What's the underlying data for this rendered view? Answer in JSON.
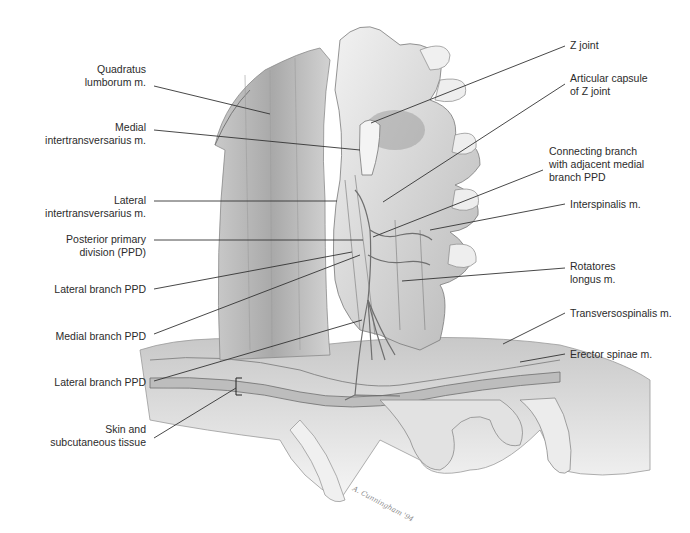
{
  "figure": {
    "signature": "A. Cunningham '94"
  },
  "labels_left": [
    {
      "id": "quadratus-lumborum",
      "lines": [
        "Quadratus",
        "lumborum m."
      ],
      "x": 146,
      "y": 70,
      "leader": [
        [
          154,
          86
        ],
        [
          270,
          114
        ]
      ]
    },
    {
      "id": "medial-intertransversarius",
      "lines": [
        "Medial",
        "intertransversarius m."
      ],
      "x": 146,
      "y": 121,
      "leader": [
        [
          154,
          130
        ],
        [
          360,
          150
        ]
      ]
    },
    {
      "id": "lateral-intertransversarius",
      "lines": [
        "Lateral",
        "intertransversarius m."
      ],
      "x": 146,
      "y": 187,
      "leader": [
        [
          154,
          201
        ],
        [
          337,
          201
        ]
      ]
    },
    {
      "id": "posterior-primary-division",
      "lines": [
        "Posterior primary",
        "division (PPD)"
      ],
      "x": 146,
      "y": 229,
      "leader": [
        [
          154,
          240
        ],
        [
          363,
          240
        ]
      ]
    },
    {
      "id": "lateral-branch-ppd-1",
      "lines": [
        "Lateral branch PPD"
      ],
      "x": 146,
      "y": 284,
      "leader": [
        [
          154,
          289
        ],
        [
          352,
          252
        ]
      ]
    },
    {
      "id": "medial-branch-ppd",
      "lines": [
        "Medial branch PPD"
      ],
      "x": 146,
      "y": 330,
      "leader": [
        [
          154,
          334
        ],
        [
          360,
          255
        ]
      ]
    },
    {
      "id": "lateral-branch-ppd-2",
      "lines": [
        "Lateral branch PPD"
      ],
      "x": 146,
      "y": 377,
      "leader": [
        [
          154,
          381
        ],
        [
          362,
          320
        ]
      ]
    },
    {
      "id": "skin-subcutaneous",
      "lines": [
        "Skin and",
        "subcutaneous tissue"
      ],
      "x": 146,
      "y": 425,
      "leader": [
        [
          154,
          438
        ],
        [
          236,
          388
        ]
      ]
    }
  ],
  "labels_right": [
    {
      "id": "z-joint",
      "lines": [
        "Z joint"
      ],
      "x": 570,
      "y": 39,
      "leader": [
        [
          565,
          46
        ],
        [
          371,
          123
        ]
      ]
    },
    {
      "id": "articular-capsule",
      "lines": [
        "Articular capsule",
        "of Z joint"
      ],
      "x": 570,
      "y": 72,
      "leader": [
        [
          565,
          84
        ],
        [
          383,
          202
        ]
      ]
    },
    {
      "id": "connecting-branch",
      "lines": [
        "Connecting branch",
        "with adjacent medial",
        "branch PPD"
      ],
      "x": 549,
      "y": 145,
      "leader": [
        [
          543,
          170
        ],
        [
          373,
          237
        ]
      ]
    },
    {
      "id": "interspinalis",
      "lines": [
        "Interspinalis m."
      ],
      "x": 570,
      "y": 198,
      "leader": [
        [
          565,
          204
        ],
        [
          430,
          230
        ]
      ]
    },
    {
      "id": "rotatores-longus",
      "lines": [
        "Rotatores",
        "longus m."
      ],
      "x": 570,
      "y": 258,
      "leader": [
        [
          565,
          268
        ],
        [
          402,
          281
        ]
      ]
    },
    {
      "id": "transversospinalis",
      "lines": [
        "Transversospinalis m."
      ],
      "x": 570,
      "y": 308,
      "leader": [
        [
          565,
          313
        ],
        [
          503,
          344
        ]
      ]
    },
    {
      "id": "erector-spinae",
      "lines": [
        "Erector spinae m."
      ],
      "x": 570,
      "y": 349,
      "leader": [
        [
          565,
          354
        ],
        [
          520,
          362
        ]
      ]
    }
  ],
  "colors": {
    "label_text": "#2b2b2b",
    "leader_line": "#333333",
    "bone_light": "#e9e9e9",
    "bone_mid": "#bdbdbd",
    "muscle": "#b0b0b0",
    "outline": "#7a7a7a"
  }
}
